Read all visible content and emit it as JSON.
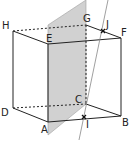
{
  "figure": {
    "type": "cube with cutting plane and line",
    "vertices": {
      "A": {
        "label": "A"
      },
      "B": {
        "label": "B"
      },
      "C": {
        "label": "C"
      },
      "D": {
        "label": "D"
      },
      "E": {
        "label": "E"
      },
      "F": {
        "label": "F"
      },
      "G": {
        "label": "G"
      },
      "H": {
        "label": "H"
      }
    },
    "points": {
      "I": {
        "label": "I"
      },
      "J": {
        "label": "J"
      }
    },
    "colors": {
      "edge": "#222222",
      "plane_fill": "#c8c8c8",
      "plane_edge": "#9a9a9a",
      "line": "#888888"
    }
  }
}
